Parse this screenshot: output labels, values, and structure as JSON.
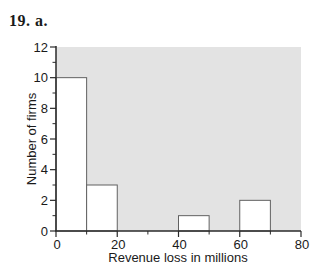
{
  "title": "19. a.",
  "chart_data": {
    "type": "bar",
    "subtype": "histogram",
    "title": "",
    "xlabel": "Revenue loss in millions",
    "ylabel": "Number of firms",
    "bins": [
      {
        "x0": 0,
        "x1": 10,
        "count": 10
      },
      {
        "x0": 10,
        "x1": 20,
        "count": 3
      },
      {
        "x0": 40,
        "x1": 50,
        "count": 1
      },
      {
        "x0": 60,
        "x1": 70,
        "count": 2
      }
    ],
    "xlim": [
      0,
      80
    ],
    "ylim": [
      0,
      12
    ],
    "x_major_ticks": [
      0,
      20,
      40,
      60,
      80
    ],
    "x_minor_ticks": [
      10,
      30,
      50,
      70
    ],
    "y_major_ticks": [
      0,
      2,
      4,
      6,
      8,
      10,
      12
    ],
    "y_minor_ticks": [
      1,
      3,
      5,
      7,
      9,
      11
    ],
    "grid": false,
    "legend": false,
    "colors": {
      "plot_background": "#e3e3e3",
      "bar_fill": "#ffffff",
      "bar_border": "#616161",
      "axis": "#2a2a2a",
      "text": "#1a1a1a"
    }
  }
}
